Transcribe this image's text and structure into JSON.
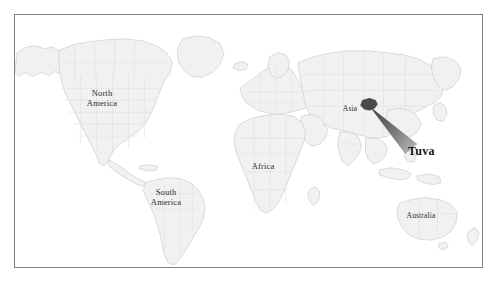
{
  "figure": {
    "kind": "world-locator-map",
    "projection": "equirectangular",
    "frame": {
      "x": 14,
      "y": 14,
      "width": 469,
      "height": 254
    },
    "background_color": "#ffffff",
    "frame_color": "#7d7f80"
  },
  "map": {
    "land_fill": "#f1f1f1",
    "land_stroke": "#c9c9c9",
    "border_stroke": "#d8d8d8",
    "ocean_fill": "#ffffff",
    "highlight_fill": "#4a4a4a",
    "cone_fill": "#6e6e6e"
  },
  "labels": [
    {
      "id": "north-america",
      "text": "North\nAmerica",
      "x": 101,
      "y": 97,
      "size": "normal"
    },
    {
      "id": "south-america",
      "text": "South\nAmerica",
      "x": 165,
      "y": 196,
      "size": "normal"
    },
    {
      "id": "africa",
      "text": "Africa",
      "x": 262,
      "y": 166,
      "size": "normal"
    },
    {
      "id": "asia",
      "text": "Asia",
      "x": 349,
      "y": 108,
      "size": "small"
    },
    {
      "id": "australia",
      "text": "Australia",
      "x": 420,
      "y": 215,
      "size": "small"
    }
  ],
  "callout": {
    "id": "tuva",
    "text": "Tuva",
    "label_x": 407,
    "label_y": 150,
    "highlight_center_x": 370,
    "highlight_center_y": 105,
    "color": "#141414"
  }
}
